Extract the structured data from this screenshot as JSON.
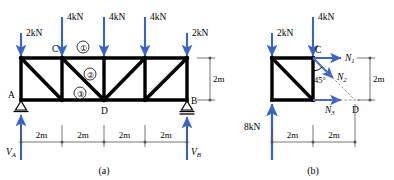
{
  "figure": {
    "caption_a": "(a)",
    "caption_b": "(b)"
  },
  "colors": {
    "load_arrow": "#3a63c8",
    "member": "#000000",
    "dimension": "#555555",
    "dashed": "#888888",
    "background": "#ffffff"
  },
  "panel_a": {
    "loads": [
      {
        "label": "2kN",
        "at_node": "A-top"
      },
      {
        "label": "4kN",
        "at_node": "C"
      },
      {
        "label": "4kN",
        "at_node": "top-mid"
      },
      {
        "label": "4kN",
        "at_node": "top-right-mid"
      },
      {
        "label": "2kN",
        "at_node": "B-top"
      }
    ],
    "joint_labels": [
      "A",
      "B",
      "C",
      "D"
    ],
    "member_labels": [
      "①",
      "②",
      "③"
    ],
    "height_dimension": "2m",
    "span_dimensions": [
      "2m",
      "2m",
      "2m",
      "2m"
    ],
    "reactions": [
      {
        "label": "V",
        "sub": "A"
      },
      {
        "label": "V",
        "sub": "B"
      }
    ],
    "supports": [
      {
        "type": "pin",
        "at": "A"
      },
      {
        "type": "roller",
        "at": "B"
      }
    ]
  },
  "panel_b": {
    "loads": [
      {
        "label": "2kN",
        "direction": "down"
      },
      {
        "label": "4kN",
        "direction": "down"
      },
      {
        "label": "8kN",
        "direction": "up"
      }
    ],
    "joint_labels": [
      "C",
      "D"
    ],
    "forces": [
      {
        "label": "N",
        "sub": "1",
        "direction": "right"
      },
      {
        "label": "N",
        "sub": "2",
        "direction": "down-right-45"
      },
      {
        "label": "N",
        "sub": "3",
        "direction": "right"
      }
    ],
    "angle_label": "45°",
    "height_dimension": "2m",
    "span_dimensions": [
      "2m",
      "2m"
    ]
  }
}
